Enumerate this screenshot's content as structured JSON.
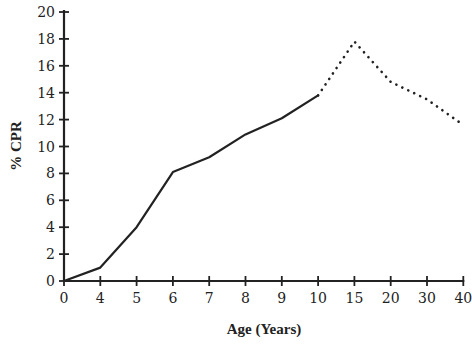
{
  "chart_data": {
    "type": "line",
    "title": "",
    "xlabel": "Age (Years)",
    "ylabel": "% CPR",
    "x_tick_labels": [
      "0",
      "4",
      "5",
      "6",
      "7",
      "8",
      "9",
      "10",
      "15",
      "20",
      "30",
      "40"
    ],
    "y_tick_labels": [
      "0",
      "2",
      "4",
      "6",
      "8",
      "10",
      "12",
      "14",
      "16",
      "18",
      "20"
    ],
    "ylim": [
      0,
      20
    ],
    "grid": false,
    "legend": null,
    "series": [
      {
        "name": "observed",
        "style": "solid",
        "x": [
          0,
          4,
          5,
          6,
          7,
          8,
          9,
          10
        ],
        "values": [
          0,
          1.0,
          4.0,
          8.1,
          9.2,
          10.9,
          12.1,
          13.8
        ]
      },
      {
        "name": "projected",
        "style": "dotted",
        "x": [
          10,
          15,
          20,
          30,
          40
        ],
        "values": [
          13.8,
          17.8,
          14.8,
          13.5,
          11.6
        ]
      }
    ],
    "colors": {
      "line": "#222222",
      "axis": "#222222"
    }
  }
}
